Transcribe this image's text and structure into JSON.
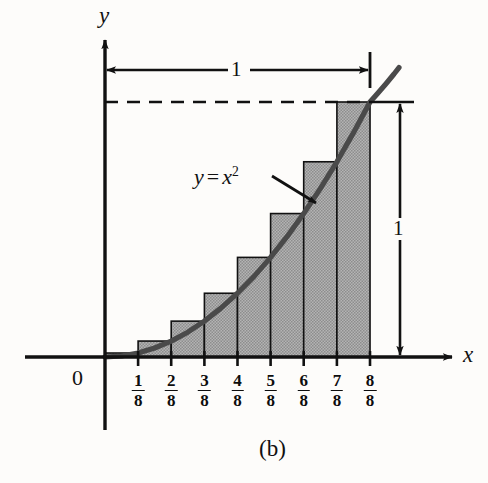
{
  "figure": {
    "caption": "(b)",
    "background_color": "#fdfcfa",
    "ink_color": "#111111",
    "fill_color": "#a9a9a9",
    "curve_color": "#3a3a3a"
  },
  "axes": {
    "x_label": "x",
    "y_label": "y",
    "origin_label": "0",
    "x_tick_labels": [
      {
        "num": "1",
        "den": "8"
      },
      {
        "num": "2",
        "den": "8"
      },
      {
        "num": "3",
        "den": "8"
      },
      {
        "num": "4",
        "den": "8"
      },
      {
        "num": "5",
        "den": "8"
      },
      {
        "num": "6",
        "den": "8"
      },
      {
        "num": "7",
        "den": "8"
      },
      {
        "num": "8",
        "den": "8"
      }
    ]
  },
  "annotations": {
    "curve_label_y": "y",
    "curve_label_eq": "=",
    "curve_label_x": "x",
    "curve_label_exp": "2",
    "width_dimension": "1",
    "height_dimension": "1"
  },
  "chart_data": {
    "type": "bar",
    "title": "(b)",
    "xlabel": "x",
    "ylabel": "y",
    "function": "y = x^2",
    "categories": [
      "1/8",
      "2/8",
      "3/8",
      "4/8",
      "5/8",
      "6/8",
      "7/8",
      "8/8"
    ],
    "x": [
      0.125,
      0.25,
      0.375,
      0.5,
      0.625,
      0.75,
      0.875,
      1.0
    ],
    "values": [
      0.015625,
      0.0625,
      0.140625,
      0.25,
      0.390625,
      0.5625,
      0.765625,
      1.0
    ],
    "rectangle_type": "upper-circumscribed",
    "n_rectangles": 8,
    "partition_width": 0.125,
    "xlim": [
      0,
      1
    ],
    "ylim": [
      0,
      1
    ],
    "grid": false,
    "legend": "none",
    "curve_series": {
      "name": "y = x^2",
      "x": [
        0,
        0.125,
        0.25,
        0.375,
        0.5,
        0.625,
        0.75,
        0.875,
        1.0,
        1.08
      ],
      "y": [
        0,
        0.015625,
        0.0625,
        0.140625,
        0.25,
        0.390625,
        0.5625,
        0.765625,
        1.0,
        1.1664
      ]
    },
    "annotations": [
      {
        "label": "1",
        "type": "width-dimension",
        "from": 0,
        "to": 1.0,
        "axis": "x"
      },
      {
        "label": "1",
        "type": "height-dimension",
        "from": 0,
        "to": 1.0,
        "axis": "y"
      },
      {
        "label": "y = x^2",
        "type": "curve-callout"
      }
    ]
  }
}
